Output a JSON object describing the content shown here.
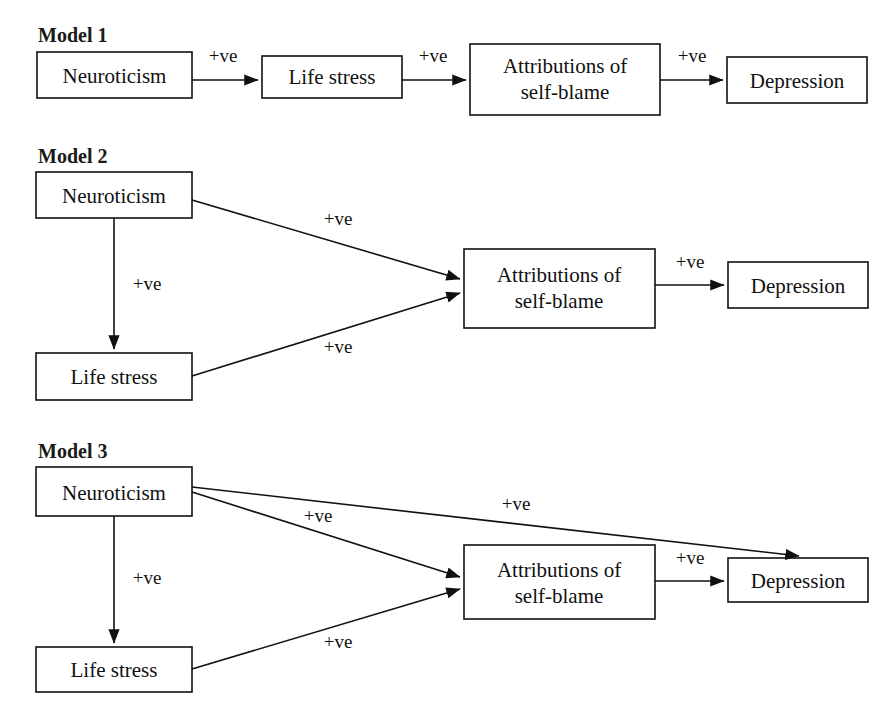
{
  "page": {
    "background_color": "#ffffff",
    "line_color": "#111111",
    "text_color": "#111111"
  },
  "models": [
    {
      "title": "Model 1",
      "nodes": {
        "neuroticism": "Neuroticism",
        "life_stress": "Life stress",
        "attributions_line1": "Attributions of",
        "attributions_line2": "self-blame",
        "depression": "Depression"
      },
      "edges": [
        {
          "from": "neuroticism",
          "to": "life_stress",
          "label": "+ve"
        },
        {
          "from": "life_stress",
          "to": "attributions",
          "label": "+ve"
        },
        {
          "from": "attributions",
          "to": "depression",
          "label": "+ve"
        }
      ]
    },
    {
      "title": "Model 2",
      "nodes": {
        "neuroticism": "Neuroticism",
        "life_stress": "Life stress",
        "attributions_line1": "Attributions of",
        "attributions_line2": "self-blame",
        "depression": "Depression"
      },
      "edges": [
        {
          "from": "neuroticism",
          "to": "life_stress",
          "label": "+ve"
        },
        {
          "from": "neuroticism",
          "to": "attributions",
          "label": "+ve"
        },
        {
          "from": "life_stress",
          "to": "attributions",
          "label": "+ve"
        },
        {
          "from": "attributions",
          "to": "depression",
          "label": "+ve"
        }
      ]
    },
    {
      "title": "Model 3",
      "nodes": {
        "neuroticism": "Neuroticism",
        "life_stress": "Life stress",
        "attributions_line1": "Attributions of",
        "attributions_line2": "self-blame",
        "depression": "Depression"
      },
      "edges": [
        {
          "from": "neuroticism",
          "to": "life_stress",
          "label": "+ve"
        },
        {
          "from": "neuroticism",
          "to": "attributions",
          "label": "+ve"
        },
        {
          "from": "neuroticism",
          "to": "depression",
          "label": "+ve"
        },
        {
          "from": "life_stress",
          "to": "attributions",
          "label": "+ve"
        },
        {
          "from": "attributions",
          "to": "depression",
          "label": "+ve"
        }
      ]
    }
  ]
}
